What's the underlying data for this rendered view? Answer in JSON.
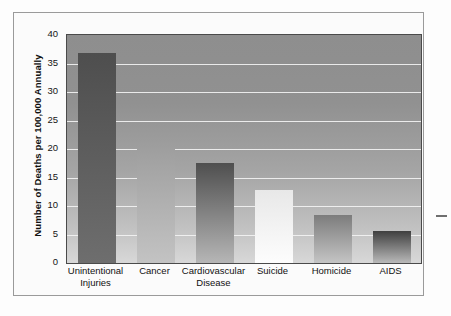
{
  "figure": {
    "name": "leading-causes-of-death-bar-chart",
    "right_dash_marker": "—"
  },
  "chart_data": {
    "type": "bar",
    "title": "",
    "xlabel": "",
    "ylabel": "Number of Deaths per 100,000 Annually",
    "categories": [
      "Unintentional Injuries",
      "Cancer",
      "Cardiovascular Disease",
      "Suicide",
      "Homicide",
      "AIDS"
    ],
    "category_labels_wrapped": [
      "Unintentional\nInjuries",
      "Cancer",
      "Cardiovascular\nDisease",
      "Suicide",
      "Homicide",
      "AIDS"
    ],
    "values": [
      36.8,
      20.8,
      17.6,
      12.8,
      8.5,
      5.6
    ],
    "ylim": [
      0,
      40
    ],
    "ytick_labels": [
      "0",
      "5",
      "10",
      "15",
      "20",
      "25",
      "30",
      "35",
      "40"
    ],
    "ytick_values": [
      0,
      5,
      10,
      15,
      20,
      25,
      30,
      35,
      40
    ],
    "grid": true,
    "grid_color": "#f2f2f2",
    "legend": "none",
    "bar_colors_top": [
      "#4e4e4e",
      "#9d9d9d",
      "#4f4f4f",
      "#e8e8e8",
      "#7c7c7c",
      "#3f3f3f"
    ],
    "bar_colors_bottom": [
      "#6e6e6e",
      "#c3c3c3",
      "#b6b6b6",
      "#fdfdfd",
      "#c4c4c4",
      "#b9b9b9"
    ],
    "plot_background_top": "#8e8e8e",
    "plot_background_bottom": "#d8d8d8",
    "axis_color": "#4a4a4a",
    "text_color": "#111111"
  }
}
